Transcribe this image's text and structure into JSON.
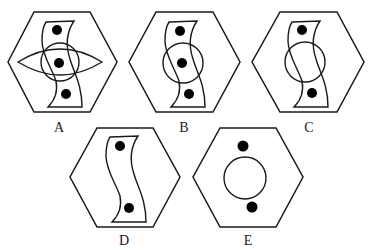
{
  "title_text_visible": "",
  "options": [
    {
      "label": "A",
      "elements": [
        "hexagon",
        "s-shape",
        "circle",
        "eye-shape",
        "three-dots"
      ]
    },
    {
      "label": "B",
      "elements": [
        "hexagon",
        "s-shape",
        "circle",
        "three-dots"
      ]
    },
    {
      "label": "C",
      "elements": [
        "hexagon",
        "s-shape",
        "circle",
        "two-dots"
      ]
    },
    {
      "label": "D",
      "elements": [
        "hexagon",
        "s-shape",
        "two-dots"
      ]
    },
    {
      "label": "E",
      "elements": [
        "hexagon",
        "circle",
        "two-dots"
      ]
    }
  ],
  "colors": {
    "stroke": "#1a1a1a",
    "fill_dot": "#000000",
    "background": "#ffffff"
  }
}
